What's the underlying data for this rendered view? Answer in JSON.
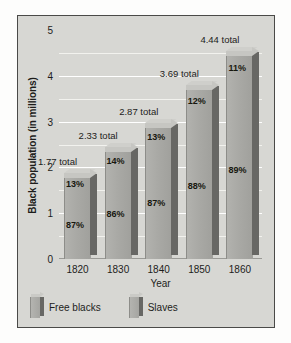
{
  "chart_data": {
    "type": "bar",
    "subtype": "stacked-3d-column",
    "title": "",
    "xlabel": "Year",
    "ylabel": "Black population (in millions)",
    "categories": [
      "1820",
      "1830",
      "1840",
      "1850",
      "1860"
    ],
    "ylim": [
      0,
      5
    ],
    "yticks": [
      0,
      1,
      2,
      3,
      4,
      5
    ],
    "ytick_labels": [
      "0",
      "1",
      "2",
      "3",
      "4",
      "5"
    ],
    "minor_gridlines": [
      0.5,
      1.5,
      2.5,
      3.5,
      4.5
    ],
    "grid": true,
    "legend_position": "bottom-left",
    "totals": [
      1.77,
      2.33,
      2.87,
      3.69,
      4.44
    ],
    "total_labels": [
      "1.77 total",
      "2.33 total",
      "2.87 total",
      "3.69 total",
      "4.44 total"
    ],
    "series": [
      {
        "name": "Free blacks",
        "values": [
          13,
          14,
          13,
          12,
          11
        ],
        "unit": "percent",
        "labels": [
          "13%",
          "14%",
          "13%",
          "12%",
          "11%"
        ]
      },
      {
        "name": "Slaves",
        "values": [
          87,
          86,
          87,
          88,
          89
        ],
        "unit": "percent",
        "labels": [
          "87%",
          "86%",
          "87%",
          "88%",
          "89%"
        ]
      }
    ],
    "colors": {
      "panel_background": "#d7d7d3",
      "gridline": "#ffffff",
      "bar_front": "#a9a9a5",
      "bar_side": "#676764",
      "bar_top": "#c6c6c2",
      "text": "#1d1d1b",
      "border": "#4a4a48"
    }
  },
  "axes": {
    "ylabel": "Black population (in millions)",
    "xlabel": "Year"
  },
  "legend": {
    "items": [
      {
        "label": "Free blacks"
      },
      {
        "label": "Slaves"
      }
    ]
  }
}
